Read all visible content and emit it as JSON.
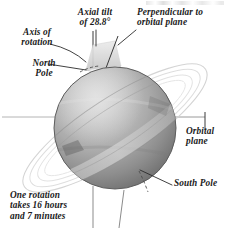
{
  "figure": {
    "background_color": "#ffffff",
    "width": 231,
    "height": 233
  },
  "labels": {
    "axial_tilt": "Axial tilt\nof 28.8°",
    "perpendicular": "Perpendicular to\norbital plane",
    "axis_of_rotation": "Axis of\nrotation",
    "north_pole": "North\nPole",
    "orbital_plane": "Orbital\nplane",
    "south_pole": "South Pole",
    "rotation_period": "One rotation\ntakes 16 hours\nand 7 minutes"
  },
  "values": {
    "axial_tilt_degrees": "28.8°",
    "rotation_hours": "16",
    "rotation_minutes": "7"
  },
  "colors": {
    "ink": "#1a1a1a",
    "leader_line": "#2b2b2b",
    "sphere_light": "#cfcfcf",
    "sphere_mid": "#a6a6a6",
    "sphere_dark": "#6e6e6e",
    "sphere_edge": "#585858",
    "ring": "#d9d9d9",
    "tilt_wedge": "#dcdcdc",
    "plane_line": "#9a9a9a"
  },
  "elements": {
    "planet": "planet-sphere",
    "rings": "planet-rings",
    "perpendicular_axis": "perpendicular-axis-line",
    "rotation_axis": "rotation-axis-line",
    "tilt_wedge": "axial-tilt-wedge",
    "orbital_plane_line": "orbital-plane-line",
    "north_pole_marker": "north-pole-dashed-marker",
    "south_pole_marker": "south-pole-dashed-marker"
  }
}
